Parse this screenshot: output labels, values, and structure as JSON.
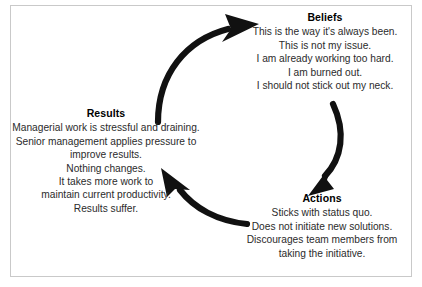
{
  "diagram": {
    "type": "cycle",
    "direction": "clockwise",
    "colors": {
      "arrow": "#111111",
      "text": "#2b2b2b",
      "title": "#000000",
      "frame": "#c9c9c9",
      "background": "#ffffff"
    },
    "nodes": [
      {
        "id": "beliefs",
        "title": "Beliefs",
        "lines": [
          "This is the way it's always been.",
          "This is not my issue.",
          "I am already working too hard.",
          "I am burned out.",
          "I should not stick out my neck."
        ]
      },
      {
        "id": "actions",
        "title": "Actions",
        "lines": [
          "Sticks with status quo.",
          "Does not initiate new solutions.",
          "Discourages team members from",
          "taking the initiative."
        ]
      },
      {
        "id": "results",
        "title": "Results",
        "lines": [
          "Managerial work is stressful and draining.",
          "Senior management applies pressure to",
          "improve results.",
          "Nothing changes.",
          "It takes more work to",
          "maintain current productivity.",
          "Results suffer."
        ]
      }
    ],
    "arrows": [
      {
        "id": "results-to-beliefs",
        "from": "results",
        "to": "beliefs"
      },
      {
        "id": "beliefs-to-actions",
        "from": "beliefs",
        "to": "actions"
      },
      {
        "id": "actions-to-results",
        "from": "actions",
        "to": "results"
      }
    ]
  }
}
